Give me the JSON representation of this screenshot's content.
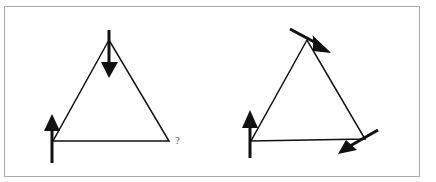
{
  "diagram": {
    "title": "",
    "colors": {
      "stroke": "#111111",
      "frame": "#a9a9a9",
      "background": "#ffffff"
    },
    "panels": [
      {
        "id": "left",
        "shape": "triangle",
        "vertices": [
          [
            109,
            40
          ],
          [
            53,
            141
          ],
          [
            169,
            141
          ]
        ],
        "arrows": [
          {
            "at": "top-vertex",
            "direction": "down",
            "from": [
              109,
              30
            ],
            "to": [
              109,
              78
            ]
          },
          {
            "at": "bottom-left-vertex",
            "direction": "up",
            "from": [
              52,
              163
            ],
            "to": [
              52,
              114
            ]
          }
        ],
        "unknown_label": "?",
        "unknown_at": "bottom-right-vertex"
      },
      {
        "id": "right",
        "shape": "triangle",
        "vertices": [
          [
            307,
            40
          ],
          [
            251,
            141
          ],
          [
            365,
            139
          ]
        ],
        "arrows": [
          {
            "at": "top-vertex",
            "direction": "down-right",
            "from": [
              290,
              29
            ],
            "to": [
              330,
              52
            ]
          },
          {
            "at": "bottom-left-vertex",
            "direction": "up",
            "from": [
              250,
              158
            ],
            "to": [
              250,
              110
            ]
          },
          {
            "at": "bottom-right-vertex",
            "direction": "down-left",
            "from": [
              378,
              130
            ],
            "to": [
              338,
              154
            ]
          }
        ]
      }
    ]
  }
}
